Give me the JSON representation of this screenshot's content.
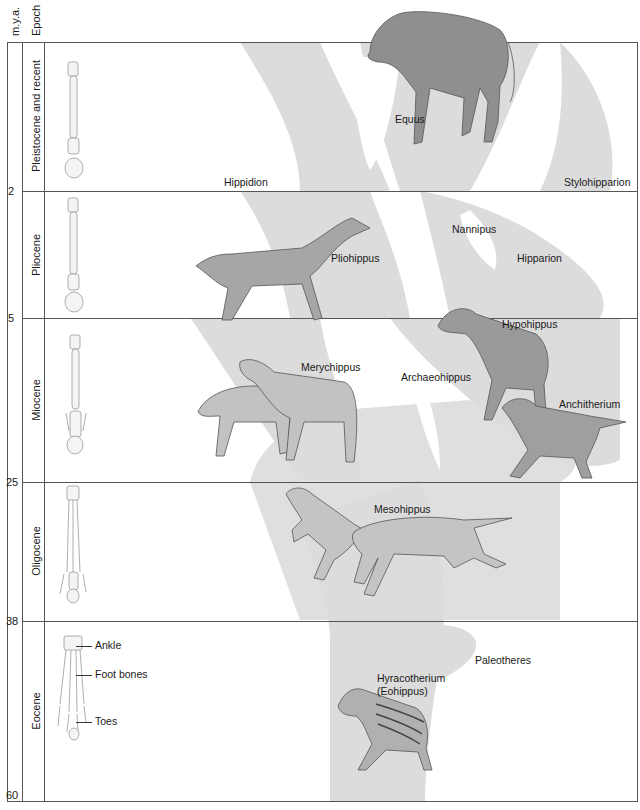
{
  "headers": {
    "mya": "m.y.a.",
    "epoch": "Epoch"
  },
  "epochs": [
    {
      "name": "Pleistocene and recent",
      "mya_end": "2"
    },
    {
      "name": "Pliocene",
      "mya_end": "5"
    },
    {
      "name": "Miocene",
      "mya_end": "25"
    },
    {
      "name": "Oligocene",
      "mya_end": "38"
    },
    {
      "name": "Eocene",
      "mya_end": "60"
    }
  ],
  "genera": {
    "equus": "Equus",
    "hippidion": "Hippidion",
    "stylohipparion": "Stylohipparion",
    "nannipus": "Nannipus",
    "pliohippus": "Pliohippus",
    "hipparion": "Hipparion",
    "hypohippus": "Hypohippus",
    "merychippus": "Merychippus",
    "archaeohippus": "Archaeohippus",
    "anchitherium": "Anchitherium",
    "mesohippus": "Mesohippus",
    "paleotheres": "Paleotheres",
    "hyracotherium": "Hyracotherium",
    "eohippus": "(Eohippus)"
  },
  "foot_annotations": {
    "ankle": "Ankle",
    "foot_bones": "Foot bones",
    "toes": "Toes"
  },
  "colors": {
    "tree_fill": "#d9d9d9",
    "frame": "#555555",
    "horse": "#8a8a8a"
  }
}
